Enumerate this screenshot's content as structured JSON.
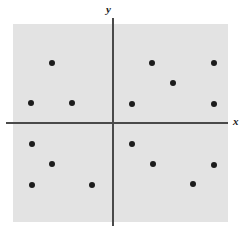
{
  "figure": {
    "width": 246,
    "height": 234,
    "background_color": "#ffffff",
    "panel_color": "#e3e3e3",
    "axis_color": "#4a4a4a",
    "point_color": "#1c1c1c"
  },
  "axes": {
    "y_label": "y",
    "x_label": "x",
    "origin_px": {
      "x": 113,
      "y": 123
    }
  },
  "chart_data": {
    "type": "scatter",
    "title": "",
    "xlabel": "x",
    "ylabel": "y",
    "grid": false,
    "legend": null,
    "axis_style": "cartesian-cross",
    "xlim": [
      -100,
      115
    ],
    "ylim": [
      -99,
      99
    ],
    "n_points": 16,
    "points_px": [
      {
        "x": 52,
        "y": 63,
        "quadrant": "II"
      },
      {
        "x": 31,
        "y": 103,
        "quadrant": "II"
      },
      {
        "x": 72,
        "y": 103,
        "quadrant": "II"
      },
      {
        "x": 152,
        "y": 63,
        "quadrant": "I"
      },
      {
        "x": 214,
        "y": 63,
        "quadrant": "I"
      },
      {
        "x": 173,
        "y": 83,
        "quadrant": "I"
      },
      {
        "x": 132,
        "y": 104,
        "quadrant": "I"
      },
      {
        "x": 214,
        "y": 104,
        "quadrant": "I"
      },
      {
        "x": 32,
        "y": 144,
        "quadrant": "III"
      },
      {
        "x": 52,
        "y": 164,
        "quadrant": "III"
      },
      {
        "x": 32,
        "y": 185,
        "quadrant": "III"
      },
      {
        "x": 92,
        "y": 185,
        "quadrant": "III"
      },
      {
        "x": 132,
        "y": 144,
        "quadrant": "IV"
      },
      {
        "x": 153,
        "y": 164,
        "quadrant": "IV"
      },
      {
        "x": 214,
        "y": 165,
        "quadrant": "IV"
      },
      {
        "x": 193,
        "y": 184,
        "quadrant": "IV"
      }
    ],
    "points_data": [
      {
        "x": -61,
        "y": 60
      },
      {
        "x": -82,
        "y": 20
      },
      {
        "x": -41,
        "y": 20
      },
      {
        "x": 39,
        "y": 60
      },
      {
        "x": 101,
        "y": 60
      },
      {
        "x": 60,
        "y": 40
      },
      {
        "x": 19,
        "y": 19
      },
      {
        "x": 101,
        "y": 19
      },
      {
        "x": -81,
        "y": -21
      },
      {
        "x": -61,
        "y": -41
      },
      {
        "x": -81,
        "y": -62
      },
      {
        "x": -21,
        "y": -62
      },
      {
        "x": 19,
        "y": -21
      },
      {
        "x": 40,
        "y": -41
      },
      {
        "x": 101,
        "y": -42
      },
      {
        "x": 80,
        "y": -61
      }
    ],
    "quadrant_counts": {
      "I": 5,
      "II": 3,
      "III": 4,
      "IV": 4
    }
  }
}
